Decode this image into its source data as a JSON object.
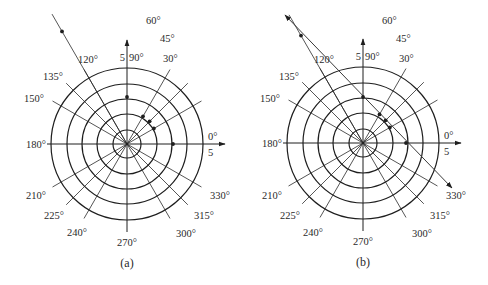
{
  "figure": {
    "panels": [
      {
        "id": "a",
        "caption": "(a)",
        "center": [
          127,
          144
        ],
        "ring_radii": [
          14,
          30,
          45,
          60,
          76
        ],
        "axis_labels": {
          "top_value": "5",
          "top_angle": "90°",
          "right_angle": "0°",
          "right_value": "5",
          "left_angle": "180°",
          "bottom_angle": "270°"
        },
        "ray_labels": [
          {
            "angle": 30,
            "text": "30°",
            "pos": [
              163,
              62
            ],
            "anchor": "start"
          },
          {
            "angle": 45,
            "text": "45°",
            "pos": [
              160,
              42
            ],
            "anchor": "start"
          },
          {
            "angle": 60,
            "text": "60°",
            "pos": [
              146,
              24
            ],
            "anchor": "start"
          },
          {
            "angle": 120,
            "text": "120°",
            "pos": [
              78,
              63
            ],
            "anchor": "start"
          },
          {
            "angle": 135,
            "text": "135°",
            "pos": [
              43,
              80
            ],
            "anchor": "start"
          },
          {
            "angle": 150,
            "text": "150°",
            "pos": [
              24,
              102
            ],
            "anchor": "start"
          },
          {
            "angle": 210,
            "text": "210°",
            "pos": [
              26,
              199
            ],
            "anchor": "start"
          },
          {
            "angle": 225,
            "text": "225°",
            "pos": [
              44,
              219
            ],
            "anchor": "start"
          },
          {
            "angle": 240,
            "text": "240°",
            "pos": [
              67,
              236
            ],
            "anchor": "start"
          },
          {
            "angle": 300,
            "text": "300°",
            "pos": [
              176,
              237
            ],
            "anchor": "start"
          },
          {
            "angle": 315,
            "text": "315°",
            "pos": [
              194,
              219
            ],
            "anchor": "start"
          },
          {
            "angle": 330,
            "text": "330°",
            "pos": [
              210,
              199
            ],
            "anchor": "start"
          }
        ],
        "rays": [
          30,
          45,
          60,
          120,
          135,
          150,
          210,
          225,
          240,
          300,
          315,
          330
        ],
        "ray_length": 86,
        "points": [
          {
            "angle": 90,
            "r": 47
          },
          {
            "angle": 60,
            "r": 32
          },
          {
            "angle": 45,
            "r": 32
          },
          {
            "angle": 30,
            "r": 31
          },
          {
            "angle": 0,
            "r": 46
          },
          {
            "angle": 120,
            "r": 130
          }
        ],
        "extended_ray": {
          "angle": 120,
          "length": 150
        }
      },
      {
        "id": "b",
        "caption": "(b)",
        "center": [
          363,
          143
        ],
        "ring_radii": [
          14,
          30,
          45,
          60,
          76
        ],
        "axis_labels": {
          "top_value": "5",
          "top_angle": "90°",
          "right_angle": "0°",
          "right_value": "5",
          "left_angle": "180°",
          "bottom_angle": "270°"
        },
        "ray_labels": [
          {
            "angle": 30,
            "text": "30°",
            "pos": [
              399,
              62
            ],
            "anchor": "start"
          },
          {
            "angle": 45,
            "text": "45°",
            "pos": [
              396,
              42
            ],
            "anchor": "start"
          },
          {
            "angle": 60,
            "text": "60°",
            "pos": [
              382,
              24
            ],
            "anchor": "start"
          },
          {
            "angle": 120,
            "text": "120°",
            "pos": [
              314,
              63
            ],
            "anchor": "start"
          },
          {
            "angle": 135,
            "text": "135°",
            "pos": [
              279,
              80
            ],
            "anchor": "start"
          },
          {
            "angle": 150,
            "text": "150°",
            "pos": [
              260,
              102
            ],
            "anchor": "start"
          },
          {
            "angle": 210,
            "text": "210°",
            "pos": [
              262,
              199
            ],
            "anchor": "start"
          },
          {
            "angle": 225,
            "text": "225°",
            "pos": [
              280,
              219
            ],
            "anchor": "start"
          },
          {
            "angle": 240,
            "text": "240°",
            "pos": [
              303,
              236
            ],
            "anchor": "start"
          },
          {
            "angle": 300,
            "text": "300°",
            "pos": [
              412,
              237
            ],
            "anchor": "start"
          },
          {
            "angle": 315,
            "text": "315°",
            "pos": [
              430,
              219
            ],
            "anchor": "start"
          },
          {
            "angle": 330,
            "text": "330°",
            "pos": [
              446,
              199
            ],
            "anchor": "start"
          }
        ],
        "rays": [
          30,
          45,
          60,
          120,
          135,
          150,
          210,
          225,
          240,
          300,
          315,
          330
        ],
        "ray_length": 86,
        "points": [
          {
            "angle": 90,
            "r": 46
          },
          {
            "angle": 60,
            "r": 33
          },
          {
            "angle": 45,
            "r": 32
          },
          {
            "angle": 30,
            "r": 31
          },
          {
            "angle": 0,
            "r": 43
          },
          {
            "angle": 120,
            "r": 124
          }
        ],
        "extended_ray": {
          "angle": 120,
          "length": 148
        },
        "fit_line": {
          "from": [
            285,
            15
          ],
          "to": [
            452,
            188
          ]
        }
      }
    ]
  }
}
